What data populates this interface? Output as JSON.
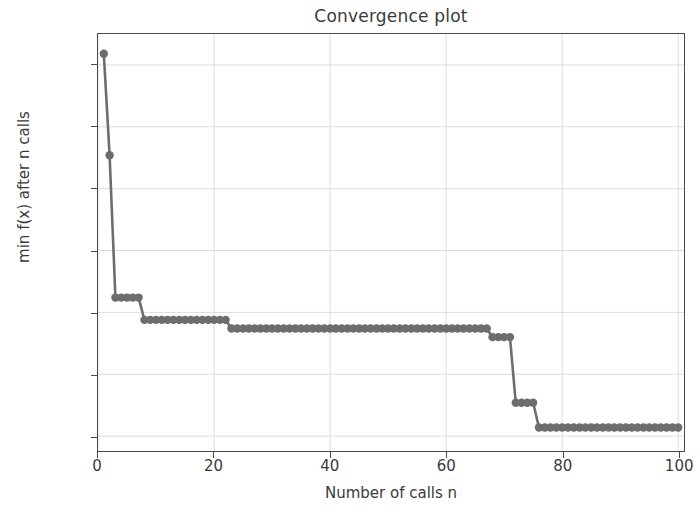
{
  "chart_data": {
    "type": "line",
    "title": "Convergence plot",
    "xlabel": "Number of calls n",
    "ylabel": "min f(x) after n calls",
    "xlim": [
      0,
      101
    ],
    "ylim": [
      -2.12,
      1.25
    ],
    "grid": true,
    "legend": null,
    "marker": "circle",
    "line_color": "#6d6d6d",
    "marker_color": "#6d6d6d",
    "xticks": [
      0,
      20,
      40,
      60,
      80,
      100
    ],
    "xticklabels": [
      "0",
      "20",
      "40",
      "60",
      "80",
      "100"
    ],
    "yticks": [
      1.0,
      0.5,
      0.0,
      -0.5,
      -1.0,
      -1.5,
      -2.0
    ],
    "yticklabels": [
      "1.0",
      "0.5",
      "0.0",
      "−0.5",
      "−1.0",
      "−1.5",
      "−2.0"
    ],
    "series": [
      {
        "name": "min f(x) after n calls",
        "x": [
          1,
          2,
          3,
          4,
          5,
          6,
          7,
          8,
          9,
          10,
          11,
          12,
          13,
          14,
          15,
          16,
          17,
          18,
          19,
          20,
          21,
          22,
          23,
          24,
          25,
          26,
          27,
          28,
          29,
          30,
          31,
          32,
          33,
          34,
          35,
          36,
          37,
          38,
          39,
          40,
          41,
          42,
          43,
          44,
          45,
          46,
          47,
          48,
          49,
          50,
          51,
          52,
          53,
          54,
          55,
          56,
          57,
          58,
          59,
          60,
          61,
          62,
          63,
          64,
          65,
          66,
          67,
          68,
          69,
          70,
          71,
          72,
          73,
          74,
          75,
          76,
          77,
          78,
          79,
          80,
          81,
          82,
          83,
          84,
          85,
          86,
          87,
          88,
          89,
          90,
          91,
          92,
          93,
          94,
          95,
          96,
          97,
          98,
          99,
          100
        ],
        "y": [
          1.09,
          0.27,
          -0.88,
          -0.88,
          -0.88,
          -0.88,
          -0.88,
          -1.06,
          -1.06,
          -1.06,
          -1.06,
          -1.06,
          -1.06,
          -1.06,
          -1.06,
          -1.06,
          -1.06,
          -1.06,
          -1.06,
          -1.06,
          -1.06,
          -1.06,
          -1.13,
          -1.13,
          -1.13,
          -1.13,
          -1.13,
          -1.13,
          -1.13,
          -1.13,
          -1.13,
          -1.13,
          -1.13,
          -1.13,
          -1.13,
          -1.13,
          -1.13,
          -1.13,
          -1.13,
          -1.13,
          -1.13,
          -1.13,
          -1.13,
          -1.13,
          -1.13,
          -1.13,
          -1.13,
          -1.13,
          -1.13,
          -1.13,
          -1.13,
          -1.13,
          -1.13,
          -1.13,
          -1.13,
          -1.13,
          -1.13,
          -1.13,
          -1.13,
          -1.13,
          -1.13,
          -1.13,
          -1.13,
          -1.13,
          -1.13,
          -1.13,
          -1.13,
          -1.2,
          -1.2,
          -1.2,
          -1.2,
          -1.73,
          -1.73,
          -1.73,
          -1.73,
          -1.93,
          -1.93,
          -1.93,
          -1.93,
          -1.93,
          -1.93,
          -1.93,
          -1.93,
          -1.93,
          -1.93,
          -1.93,
          -1.93,
          -1.93,
          -1.93,
          -1.93,
          -1.93,
          -1.93,
          -1.93,
          -1.93,
          -1.93,
          -1.93,
          -1.93,
          -1.93,
          -1.93,
          -1.93
        ]
      }
    ]
  }
}
